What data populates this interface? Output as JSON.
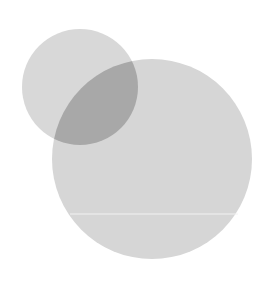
{
  "diagram": {
    "type": "venn",
    "background": "#ffffff",
    "circles": [
      {
        "name": "small-circle",
        "cx": 80,
        "cy": 87,
        "r": 58,
        "color": "#d8d8d8"
      },
      {
        "name": "large-circle",
        "cx": 152,
        "cy": 159,
        "r": 100,
        "color": "#d6d6d6"
      }
    ],
    "overlap_color": "#a8a8a8",
    "divider_line": {
      "x1": 70,
      "x2": 238,
      "y": 214,
      "color": "#f2f2f2"
    }
  }
}
